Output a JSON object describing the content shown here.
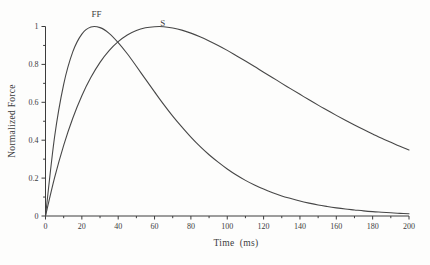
{
  "figure": {
    "background": "#fdfdfc",
    "ink": "#3c3c3c",
    "curve_color": "#474747"
  },
  "chart_data": {
    "type": "line",
    "title": "",
    "xlabel": "Time  (ms)",
    "ylabel": "Normalized Force",
    "xlim": [
      0,
      200
    ],
    "ylim": [
      0,
      1
    ],
    "grid": false,
    "frame": "left-bottom-axes-only",
    "legend_position": "inline-curve-labels",
    "x_major_ticks": [
      0,
      20,
      40,
      60,
      80,
      100,
      120,
      140,
      160,
      180,
      200
    ],
    "x_tick_labels": [
      "0",
      "20",
      "40",
      "60",
      "80",
      "100",
      "120",
      "140",
      "160",
      "180",
      "200"
    ],
    "x_minor_tick_step": 10,
    "y_major_ticks": [
      0,
      0.2,
      0.4,
      0.6,
      0.8,
      1
    ],
    "y_tick_labels": [
      "0",
      "0.2",
      "0.4",
      "0.6",
      "0.8",
      "1"
    ],
    "y_minor_tick_step": 0.1,
    "x_sample_step_ms": 5,
    "series": [
      {
        "name": "FF",
        "description": "fast-twitch motor unit, time-to-peak ~27 ms",
        "peak_time_ms": 27,
        "peak_value": 1.0,
        "values": [
          0,
          0.418,
          0.695,
          0.866,
          0.96,
          0.997,
          0.994,
          0.964,
          0.915,
          0.856,
          0.79,
          0.722,
          0.655,
          0.589,
          0.527,
          0.47,
          0.416,
          0.367,
          0.323,
          0.284,
          0.248,
          0.216,
          0.188,
          0.164,
          0.142,
          0.123,
          0.106,
          0.092,
          0.079,
          0.068,
          0.058,
          0.05,
          0.043,
          0.037,
          0.032,
          0.027,
          0.023,
          0.02,
          0.017,
          0.014,
          0.012
        ]
      },
      {
        "name": "S",
        "description": "slow-twitch motor unit, time-to-peak ~62 ms",
        "peak_time_ms": 62,
        "peak_value": 1.0,
        "values": [
          0,
          0.202,
          0.373,
          0.516,
          0.635,
          0.732,
          0.811,
          0.873,
          0.92,
          0.955,
          0.979,
          0.993,
          0.999,
          0.999,
          0.992,
          0.981,
          0.965,
          0.946,
          0.924,
          0.9,
          0.874,
          0.846,
          0.818,
          0.789,
          0.759,
          0.73,
          0.7,
          0.671,
          0.642,
          0.613,
          0.585,
          0.558,
          0.531,
          0.505,
          0.48,
          0.456,
          0.433,
          0.41,
          0.389,
          0.368,
          0.348
        ]
      }
    ],
    "annotations": [
      {
        "label": "FF",
        "t": 28,
        "v": 1.068
      },
      {
        "label": "S",
        "t": 64.5,
        "v": 1.021
      }
    ]
  }
}
